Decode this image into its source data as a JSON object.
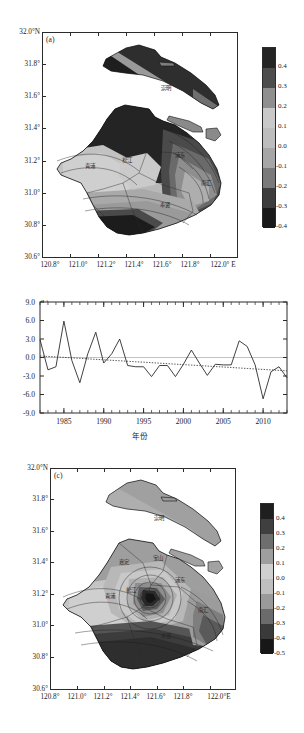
{
  "figure": {
    "panels": [
      "a",
      "b",
      "c"
    ]
  },
  "panel_a": {
    "letter": "(a)",
    "y_ticks": [
      "32.0°N",
      "31.8°",
      "31.6°",
      "31.4°",
      "31.2°",
      "31.0°",
      "30.8°",
      "30.6°"
    ],
    "x_ticks": [
      "120.8°",
      "121.0°",
      "121.2°",
      "121.4°",
      "121.6°",
      "121.8°",
      "122.0° E"
    ],
    "colorbar_labels": [
      "0.4",
      "0.3",
      "0.2",
      "0.1",
      "0.0",
      "-0.1",
      "-0.2",
      "-0.3",
      "-0.4"
    ],
    "colorbar_colors": [
      "#242424",
      "#4d4d4d",
      "#8f8f8f",
      "#c9c9c9",
      "#bdbdbd",
      "#a6a6a6",
      "#7a7a7a",
      "#3d3d3d",
      "#1a1a1a"
    ],
    "region_labels": [
      {
        "name": "崇明",
        "x": 166,
        "y": 88
      },
      {
        "name": "嘉定",
        "x": 112,
        "y": 133
      },
      {
        "name": "宝山",
        "x": 153,
        "y": 127
      },
      {
        "name": "浦东",
        "x": 180,
        "y": 155
      },
      {
        "name": "青浦",
        "x": 90,
        "y": 166
      },
      {
        "name": "松江",
        "x": 127,
        "y": 160
      },
      {
        "name": "南汇",
        "x": 206,
        "y": 183
      },
      {
        "name": "奉贤",
        "x": 165,
        "y": 205
      }
    ]
  },
  "panel_b": {
    "letter": "(b)",
    "xlabel": "年份"
  },
  "panel_c": {
    "letter": "(c)",
    "y_ticks": [
      "32.0°N",
      "31.8°",
      "31.6°",
      "31.4°",
      "31.2°",
      "31.0°",
      "30.8°",
      "30.6°"
    ],
    "x_ticks": [
      "120.8°",
      "121.0°",
      "121.2°",
      "121.4°",
      "121.6°",
      "121.8°",
      "122.0°E"
    ],
    "colorbar_labels": [
      "0.4",
      "0.3",
      "0.2",
      "0.1",
      "0.0",
      "-0.1",
      "-0.2",
      "-0.3",
      "-0.4",
      "-0.5"
    ],
    "colorbar_colors": [
      "#1f1f1f",
      "#3f3f3f",
      "#6e6e6e",
      "#9e9e9e",
      "#cfcfcf",
      "#bfbfbf",
      "#9a9a9a",
      "#6b6b6b",
      "#3a3a3a",
      "#171717"
    ],
    "region_labels": [
      {
        "name": "崇明",
        "x": 159,
        "y": 518
      },
      {
        "name": "嘉定",
        "x": 124,
        "y": 562
      },
      {
        "name": "宝山",
        "x": 158,
        "y": 558
      },
      {
        "name": "浦东",
        "x": 180,
        "y": 580
      },
      {
        "name": "青浦",
        "x": 110,
        "y": 596
      },
      {
        "name": "松江",
        "x": 131,
        "y": 590
      },
      {
        "name": "南汇",
        "x": 203,
        "y": 610
      },
      {
        "name": "奉贤",
        "x": 166,
        "y": 636
      }
    ]
  },
  "chart_data": {
    "type": "line",
    "title": "",
    "xlabel": "年份",
    "ylabel": "",
    "xlim": [
      1982,
      2013
    ],
    "ylim": [
      -9.0,
      9.0
    ],
    "xticks": [
      1985,
      1990,
      1995,
      2000,
      2005,
      2010
    ],
    "yticks": [
      -9.0,
      -6.0,
      -3.0,
      0.0,
      3.0,
      6.0,
      9.0
    ],
    "grid": false,
    "legend": "none",
    "x": [
      1982,
      1983,
      1984,
      1985,
      1986,
      1987,
      1988,
      1989,
      1990,
      1991,
      1992,
      1993,
      1994,
      1995,
      1996,
      1997,
      1998,
      1999,
      2000,
      2001,
      2002,
      2003,
      2004,
      2005,
      2006,
      2007,
      2008,
      2009,
      2010,
      2011,
      2012,
      2013
    ],
    "series": [
      {
        "name": "anomaly",
        "style": "solid",
        "values": [
          2.9,
          -2.0,
          -1.5,
          5.9,
          -0.5,
          -4.1,
          0.6,
          4.1,
          -0.9,
          0.6,
          3.0,
          -1.3,
          -1.5,
          -1.5,
          -3.1,
          -1.3,
          -1.3,
          -3.1,
          -1.1,
          1.2,
          -0.9,
          -2.9,
          -1.1,
          -1.2,
          -1.2,
          2.7,
          1.8,
          -1.2,
          -6.7,
          -2.3,
          -1.5,
          -3.3
        ]
      },
      {
        "name": "trend",
        "style": "dotted",
        "values": [
          0.25,
          0.17,
          0.09,
          0.02,
          -0.06,
          -0.14,
          -0.22,
          -0.3,
          -0.37,
          -0.45,
          -0.53,
          -0.61,
          -0.69,
          -0.76,
          -0.84,
          -0.92,
          -1.0,
          -1.08,
          -1.15,
          -1.23,
          -1.31,
          -1.39,
          -1.47,
          -1.54,
          -1.62,
          -1.7,
          -1.78,
          -1.86,
          -1.93,
          -2.01,
          -2.09,
          -2.17
        ]
      }
    ]
  }
}
